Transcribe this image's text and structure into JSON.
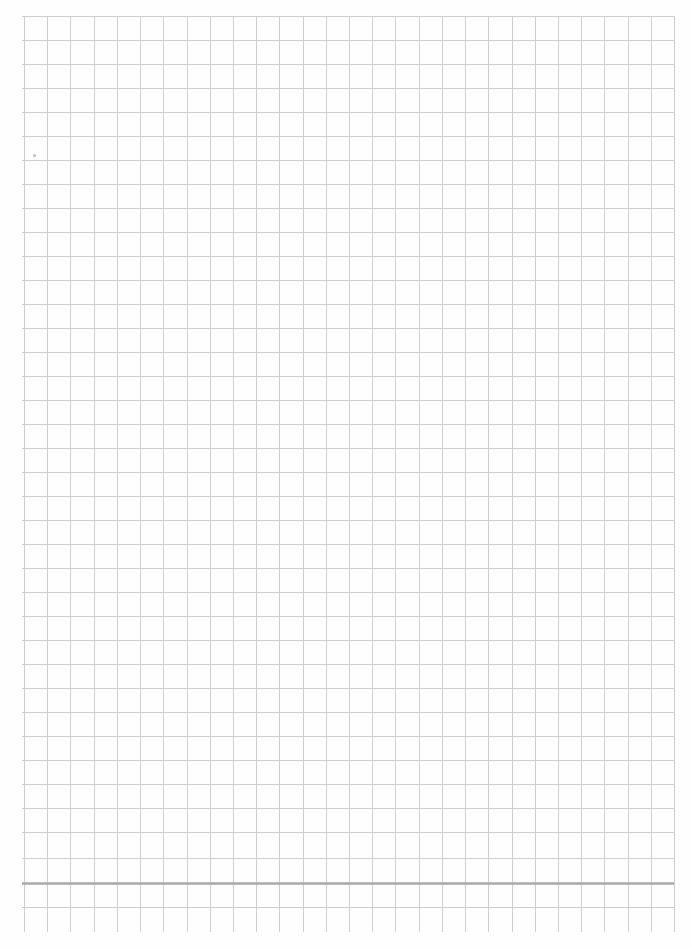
{
  "document": {
    "type": "grid-paper",
    "background_color": "#fefefe",
    "line_color": "#cfcfcf",
    "accent_line_color": "#a9a9a9",
    "grid": {
      "left": 24,
      "top": 16,
      "right": 674,
      "bottom_vertical_extent": 932,
      "columns": 28,
      "cell_width": 23.2,
      "row_lines_y": [
        16,
        40,
        64,
        88,
        112,
        136,
        160,
        184,
        208,
        232,
        256,
        280,
        304,
        328,
        352,
        376,
        400,
        424,
        448,
        472,
        496,
        520,
        544,
        568,
        592,
        616,
        640,
        664,
        688,
        712,
        736,
        760,
        784,
        808,
        832,
        858,
        883,
        907
      ],
      "accent_row_index": 36
    },
    "stray_marks": [
      {
        "x": 33,
        "y": 154
      }
    ]
  }
}
